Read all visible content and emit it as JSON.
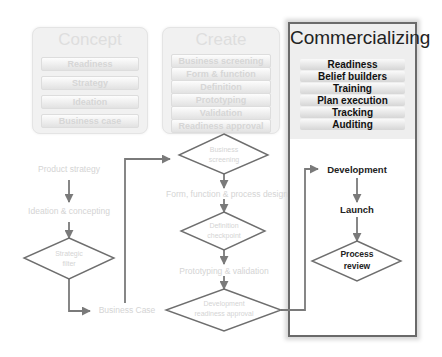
{
  "stages": {
    "concept": {
      "title": "Concept",
      "items": [
        "Readiness",
        "Strategy",
        "Ideation",
        "Business case"
      ]
    },
    "create": {
      "title": "Create",
      "items": [
        "Business screening",
        "Form & function",
        "Definition",
        "Prototyping",
        "Validation",
        "Readiness approval"
      ]
    },
    "commercializing": {
      "title": "Commercializing",
      "items": [
        "Readiness",
        "Belief builders",
        "Training",
        "Plan execution",
        "Tracking",
        "Auditing"
      ]
    }
  },
  "flow": {
    "product_strategy": "Product strategy",
    "ideation": "Ideation & concepting",
    "strategic_filter_l1": "Strategic",
    "strategic_filter_l2": "filter",
    "business_case": "Business Case",
    "business_screening_l1": "Business",
    "business_screening_l2": "screening",
    "form_function": "Form, function & process design",
    "definition_l1": "Definition",
    "definition_l2": "checkpoint",
    "prototyping": "Prototyping & validation",
    "dev_readiness_l1": "Development",
    "dev_readiness_l2": "readiness approval",
    "development": "Development",
    "launch": "Launch",
    "process_review_l1": "Process",
    "process_review_l2": "review"
  },
  "colors": {
    "faded_text": "#d4d4d4",
    "arrow": "#7a7a7a",
    "highlight_border": "#6a6a6a",
    "dark_text": "#222222"
  }
}
